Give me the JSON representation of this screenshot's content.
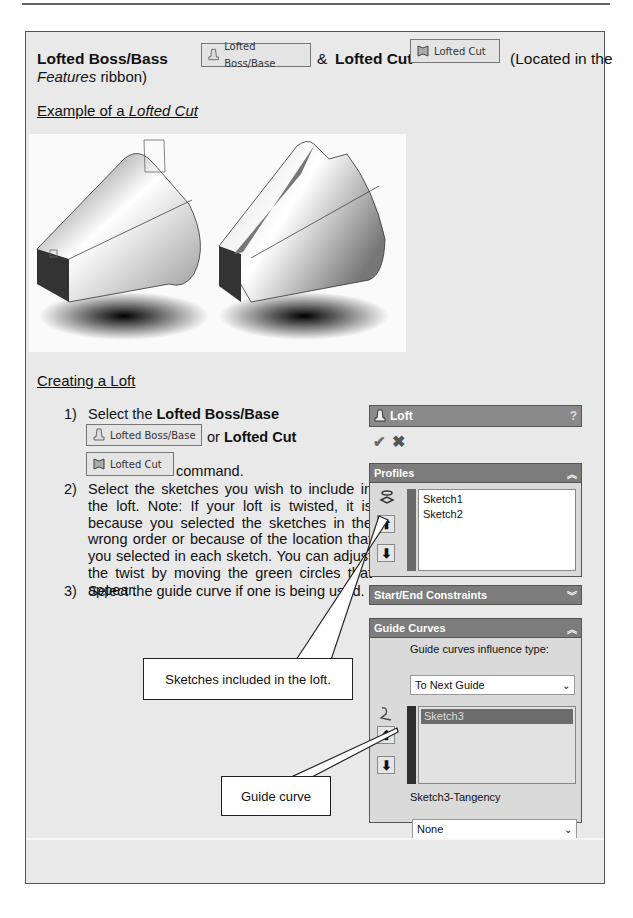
{
  "heading": {
    "title_bold_1": "Lofted Boss/Bass",
    "ribbon_button_1": {
      "label": "Lofted Boss/Base",
      "icon": "loft-boss-icon"
    },
    "ampersand": "&",
    "title_bold_2": "Lofted Cut",
    "ribbon_button_2": {
      "label": "Lofted Cut",
      "icon": "loft-cut-icon"
    },
    "location_note_1": "(Located in the",
    "location_note_italic": "Features",
    "location_note_2": "ribbon)"
  },
  "example_heading": {
    "prefix": "Example of a ",
    "italic": "Lofted Cut"
  },
  "creating_heading": "Creating a Loft",
  "steps": [
    {
      "num": "1)",
      "text_pre": "Select the ",
      "bold": "Lofted Boss/Base",
      "button_1": "Lofted Boss/Base",
      "or": "or ",
      "bold_2": "Lofted Cut",
      "button_2": "Lofted Cut",
      "text_post": "command."
    },
    {
      "num": "2)",
      "text": "Select the sketches you wish to include in the loft.  Note: If your loft is twisted, it is because you selected the sketches in the wrong order or because of the location that you selected in each sketch.  You can adjust the twist by moving the green circles that appear."
    },
    {
      "num": "3)",
      "text": "Select the guide curve if one is being used."
    }
  ],
  "property_manager": {
    "title": "Loft",
    "help": "?",
    "ok_icon": "checkmark-icon",
    "cancel_icon": "x-icon",
    "profiles": {
      "label": "Profiles",
      "items": [
        "Sketch1",
        "Sketch2"
      ],
      "bar_color": "#6a6a6a"
    },
    "start_end": {
      "label": "Start/End Constraints"
    },
    "guide_curves": {
      "label": "Guide Curves",
      "influence_label": "Guide curves influence type:",
      "influence_value": "To Next Guide",
      "items": [
        "Sketch3"
      ],
      "bar_color": "#2e2e2e",
      "tangency_label": "Sketch3-Tangency",
      "tangency_value": "None"
    }
  },
  "callouts": {
    "sketches": "Sketches included in the loft.",
    "guide": "Guide curve"
  }
}
